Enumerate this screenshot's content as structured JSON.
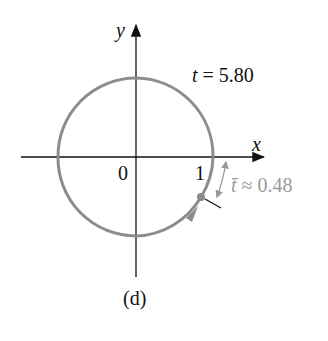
{
  "figure": {
    "caption": "(d)",
    "axes": {
      "x_label": "x",
      "y_label": "y",
      "origin_label": "0",
      "tick_one_label": "1"
    },
    "annotations": {
      "t_var": "t",
      "t_eq": "= 5.80",
      "tbar_var": "t̄",
      "tbar_eq": "≈ 0.48"
    },
    "colors": {
      "curve": "#8c8c8c",
      "axis": "#111111",
      "annotation": "#9a9a9a"
    }
  }
}
